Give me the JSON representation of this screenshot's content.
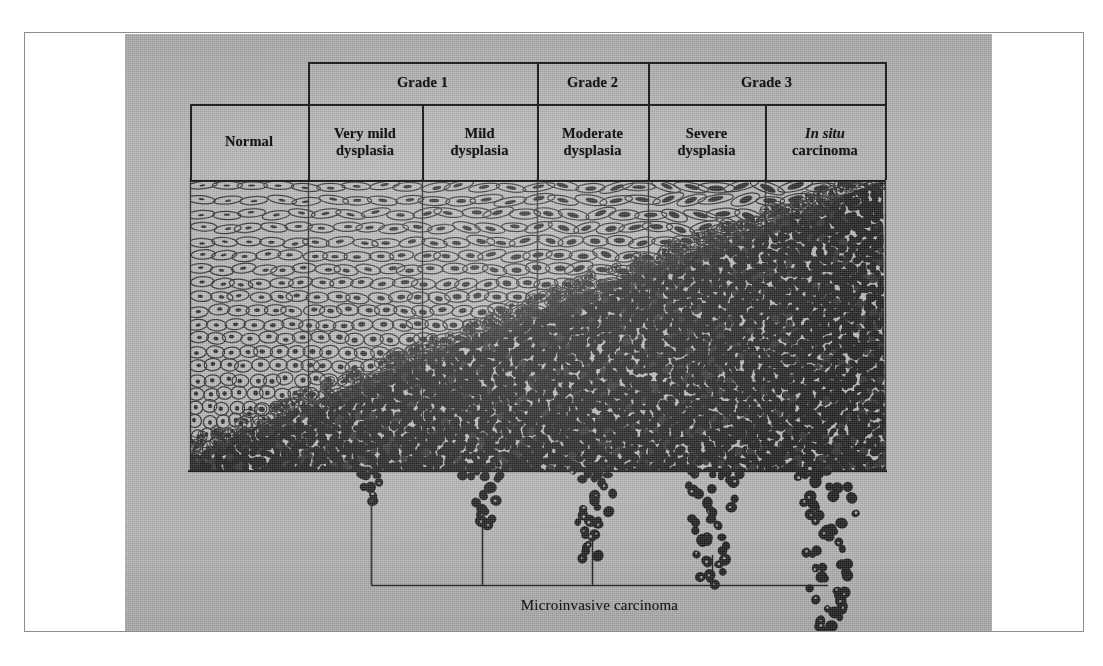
{
  "figure": {
    "kind": "histology-schematic",
    "plate_background": "#b4b4b4",
    "ink_color": "#232323"
  },
  "grade_row": {
    "cells": [
      {
        "label": "Grade 1",
        "span_columns": [
          "Very mild dysplasia",
          "Mild dysplasia"
        ],
        "x": 308,
        "w": 229
      },
      {
        "label": "Grade 2",
        "span_columns": [
          "Moderate dysplasia"
        ],
        "x": 537,
        "w": 111
      },
      {
        "label": "Grade 3",
        "span_columns": [
          "Severe dysplasia",
          "In situ carcinoma"
        ],
        "x": 648,
        "w": 237
      }
    ]
  },
  "columns": [
    {
      "id": "normal",
      "line1": "Normal",
      "line2": "",
      "italic_line1": false,
      "x": 190,
      "w": 118
    },
    {
      "id": "very-mild",
      "line1": "Very mild",
      "line2": "dysplasia",
      "italic_line1": false,
      "x": 308,
      "w": 114
    },
    {
      "id": "mild",
      "line1": "Mild",
      "line2": "dysplasia",
      "italic_line1": false,
      "x": 422,
      "w": 115
    },
    {
      "id": "moderate",
      "line1": "Moderate",
      "line2": "dysplasia",
      "italic_line1": false,
      "x": 537,
      "w": 111
    },
    {
      "id": "severe",
      "line1": "Severe",
      "line2": "dysplasia",
      "italic_line1": false,
      "x": 648,
      "w": 117
    },
    {
      "id": "in-situ",
      "line1": "In situ",
      "line2": "carcinoma",
      "italic_line1": true,
      "x": 765,
      "w": 120
    }
  ],
  "bottom": {
    "bracket_label": "Microinvasive carcinoma",
    "bracket": {
      "x1": 371,
      "x2": 828,
      "top": 497,
      "baseline": 585
    },
    "tick_positions": [
      482,
      592,
      712
    ],
    "invasion_clusters": [
      {
        "column": "very-mild",
        "cx": 371,
        "depth": 26,
        "width": 26,
        "blobs": 7
      },
      {
        "column": "mild",
        "cx": 482,
        "depth": 52,
        "width": 46,
        "blobs": 16
      },
      {
        "column": "moderate",
        "cx": 592,
        "depth": 86,
        "width": 52,
        "blobs": 26
      },
      {
        "column": "severe",
        "cx": 712,
        "depth": 112,
        "width": 56,
        "blobs": 34
      },
      {
        "column": "in-situ",
        "cx": 828,
        "depth": 160,
        "width": 66,
        "blobs": 52
      }
    ]
  },
  "epithelium": {
    "top": 180,
    "basement_membrane_y": 470,
    "left": 190,
    "right": 885,
    "description": "Maturation boundary runs diagonally: full-thickness differentiation at left (Normal) rising to full-thickness undifferentiated dark basaloid cells at right (in situ carcinoma).",
    "maturation_boundary": {
      "left_fraction_undifferentiated": 0.04,
      "right_fraction_undifferentiated": 1.0
    }
  },
  "caption_color": "#17171a"
}
